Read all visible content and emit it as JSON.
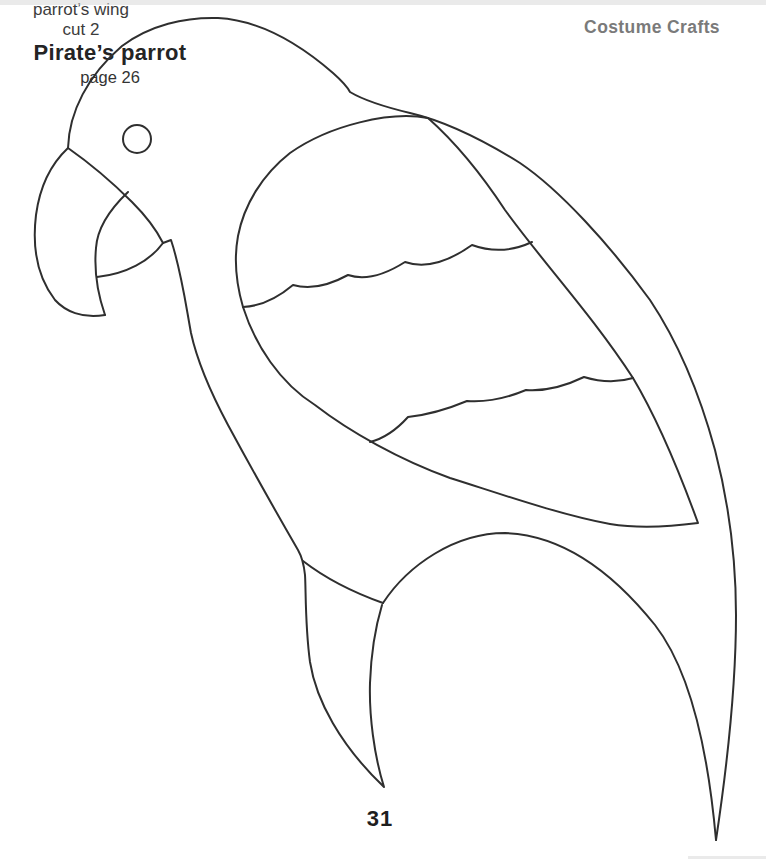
{
  "page": {
    "header": "Costume Crafts",
    "page_number": "31"
  },
  "figure": {
    "name": "pirate parrot costume template",
    "wing_label_line1": "parrot’s wing",
    "wing_label_line2": "cut 2",
    "caption_title": "Pirate’s parrot",
    "caption_subtitle": "page 26",
    "stroke_color": "#2f2f2f",
    "header_color": "#7a7a7a",
    "label_color": "#3c3c3c",
    "background_color": "#ffffff"
  }
}
